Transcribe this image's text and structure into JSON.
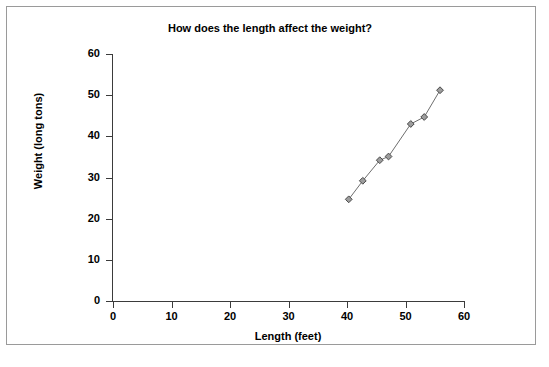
{
  "chart_data": {
    "type": "scatter",
    "title": "How does the length affect the weight?",
    "xlabel": "Length (feet)",
    "ylabel": "Weight (long tons)",
    "xlim": [
      0,
      60
    ],
    "ylim": [
      0,
      60
    ],
    "xticks": [
      0,
      10,
      20,
      30,
      40,
      50,
      60
    ],
    "yticks": [
      0,
      10,
      20,
      30,
      40,
      50,
      60
    ],
    "grid": false,
    "legend": false,
    "marker": "diamond",
    "marker_fill": "#9d9d9d",
    "marker_edge": "#4a4a4a",
    "line_color": "#6e6e6e",
    "series": [
      {
        "name": "Length vs Weight",
        "x": [
          40.3,
          42.7,
          45.6,
          47.1,
          50.9,
          53.2,
          55.9
        ],
        "y": [
          24.7,
          29.2,
          34.2,
          35.1,
          43.0,
          44.7,
          51.2
        ]
      }
    ]
  },
  "axes": {
    "x_tick_labels": [
      "0",
      "10",
      "20",
      "30",
      "40",
      "50",
      "60"
    ],
    "y_tick_labels": [
      "0",
      "10",
      "20",
      "30",
      "40",
      "50",
      "60"
    ]
  },
  "colors": {
    "border": "#9a9a9a",
    "axis": "#3b3b3b",
    "text": "#000000",
    "background": "#ffffff"
  }
}
